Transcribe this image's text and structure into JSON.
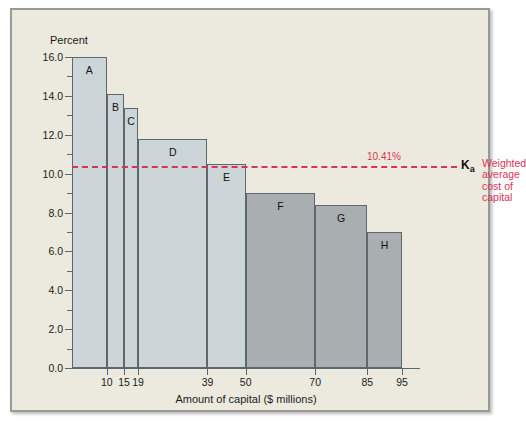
{
  "chart_data": {
    "type": "bar",
    "title": "",
    "ylabel": "Percent",
    "xlabel": "Amount of capital ($ millions)",
    "ylim": [
      0.0,
      16.0
    ],
    "xlim": [
      0,
      95
    ],
    "ytick_labels": [
      "0.0",
      "2.0",
      "4.0",
      "6.0",
      "8.0",
      "10.0",
      "12.0",
      "14.0",
      "16.0"
    ],
    "ytick_values": [
      0.0,
      2.0,
      4.0,
      6.0,
      8.0,
      10.0,
      12.0,
      14.0,
      16.0
    ],
    "yminor_values": [
      1.0,
      3.0,
      5.0,
      7.0,
      9.0,
      11.0,
      13.0,
      15.0
    ],
    "xtick_labels": [
      "10",
      "15",
      "19",
      "39",
      "50",
      "70",
      "85",
      "95"
    ],
    "xtick_values": [
      10,
      15,
      19,
      39,
      50,
      70,
      85,
      95
    ],
    "grid": false,
    "legend_position": "right-of-line",
    "bars": [
      {
        "label": "A",
        "x_start": 0,
        "x_end": 10,
        "value": 16.0,
        "fill": "#ccd5d8"
      },
      {
        "label": "B",
        "x_start": 10,
        "x_end": 15,
        "value": 14.1,
        "fill": "#ccd5d8"
      },
      {
        "label": "C",
        "x_start": 15,
        "x_end": 19,
        "value": 13.4,
        "fill": "#ccd5d8"
      },
      {
        "label": "D",
        "x_start": 19,
        "x_end": 39,
        "value": 11.8,
        "fill": "#ccd5d8"
      },
      {
        "label": "E",
        "x_start": 39,
        "x_end": 50,
        "value": 10.5,
        "fill": "#ccd5d8"
      },
      {
        "label": "F",
        "x_start": 50,
        "x_end": 70,
        "value": 9.0,
        "fill": "#a9aeb1"
      },
      {
        "label": "G",
        "x_start": 70,
        "x_end": 85,
        "value": 8.4,
        "fill": "#a9aeb1"
      },
      {
        "label": "H",
        "x_start": 85,
        "x_end": 95,
        "value": 7.0,
        "fill": "#a9aeb1"
      }
    ],
    "annotations": {
      "wacc_line_value": 10.41,
      "wacc_value_label": "10.41%",
      "wacc_symbol": "K",
      "wacc_symbol_sub": "a",
      "wacc_legend": "Weighted\naverage\ncost of\ncapital",
      "wacc_color": "#d8345a"
    }
  },
  "colors": {
    "background": "#eceade",
    "frame_border": "#9a9a94",
    "axis": "#5a6a70",
    "bar_light": "#ccd5d8",
    "bar_dark": "#a9aeb1",
    "bar_stroke": "#5d676c",
    "accent_red": "#d8345a",
    "text": "#1b1b1b"
  }
}
